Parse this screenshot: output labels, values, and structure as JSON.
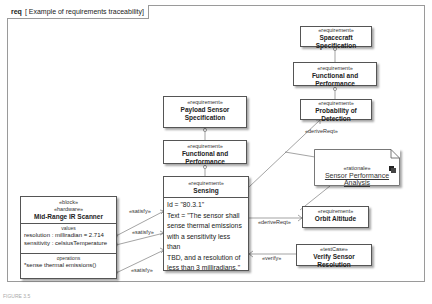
{
  "frame": {
    "kind": "req",
    "title": "[ Example of requirements traceability]"
  },
  "stereotypes": {
    "requirement": "«requirement»",
    "block": "«block»",
    "hardware": "«hardware»",
    "rationale": "«rationale»",
    "testCase": "«testCase»"
  },
  "nodes": {
    "spacecraft_spec": {
      "stereotype": "«requirement»",
      "name": "Spacecraft Specification"
    },
    "func_perf_top": {
      "stereotype": "«requirement»",
      "name": "Functional and Performance"
    },
    "prob_detection": {
      "stereotype": "«requirement»",
      "name": "Probability of Detection"
    },
    "payload_sensor_spec": {
      "stereotype": "«requirement»",
      "name_line1": "Payload Sensor",
      "name_line2": "Specification"
    },
    "func_perf_mid": {
      "stereotype": "«requirement»",
      "name": "Functional and Performance"
    },
    "sensing": {
      "stereotype": "«requirement»",
      "name": "Sensing",
      "text_lines": [
        "Id = \"80.3.1\"",
        "Text = \"The sensor shall",
        "sense thermal emissions",
        "with a sensitivity less than",
        "TBD, and a resolution of",
        "less than 3 milliradians.\""
      ]
    },
    "rationale": {
      "stereotype": "«rationale»",
      "name": "Sensor Performance Analysis"
    },
    "orbit_altitude": {
      "stereotype": "«requirement»",
      "name": "Orbit Altitude"
    },
    "verify_sensor": {
      "stereotype": "«testCase»",
      "name": "Verify Sensor Resolution"
    },
    "scanner": {
      "stereotype1": "«block»",
      "stereotype2": "«hardware»",
      "name": "Mid-Range IR Scanner",
      "values_title": "values",
      "values": [
        "resolution : milliradian = 2.714",
        "sensitivity : celsiusTemperature"
      ],
      "operations_title": "operations",
      "operations": [
        "*sense thermal emissions()"
      ]
    }
  },
  "relations": {
    "satisfy1": "«satisfy»",
    "satisfy2": "«satisfy»",
    "satisfy3": "«satisfy»",
    "derive_prob": "«deriveReqt»",
    "derive_orbit": "«deriveReqt»",
    "verify": "«verify»"
  },
  "caption": "FIGURE 3.5"
}
